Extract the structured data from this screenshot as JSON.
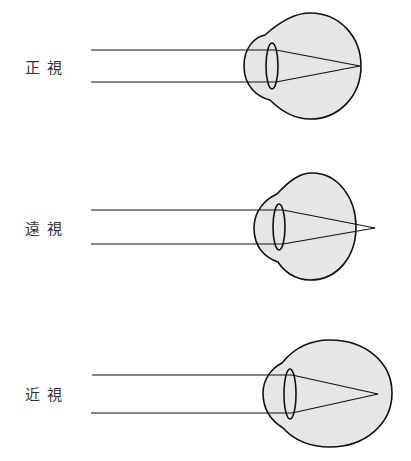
{
  "diagram": {
    "colors": {
      "stroke": "#111111",
      "fill": "#e6e6e6",
      "background": "#ffffff"
    },
    "panels": [
      {
        "label": "正視",
        "condition": "emmetropia",
        "focus": "on retina"
      },
      {
        "label": "遠視",
        "condition": "hyperopia",
        "focus": "behind retina"
      },
      {
        "label": "近視",
        "condition": "myopia",
        "focus": "in front of retina"
      }
    ]
  }
}
